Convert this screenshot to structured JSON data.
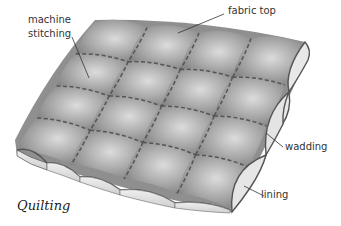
{
  "caption": "Quilting",
  "labels": {
    "machine_stitching": "machine\nstitching",
    "fabric_top": "fabric top",
    "wadding": "wadding",
    "lining": "lining"
  },
  "diagram": {
    "grid_rows": 4,
    "grid_cols": 4,
    "layers": [
      "fabric top",
      "wadding",
      "lining"
    ],
    "colors": {
      "fabric": "#8c8c8c",
      "fabric_highlight": "#d9d9d9",
      "wadding": "#e6e6e6",
      "stitch": "#555555",
      "leader_line": "#333333"
    }
  }
}
